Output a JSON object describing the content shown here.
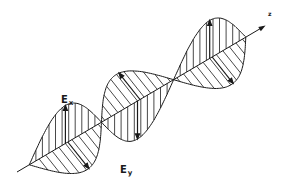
{
  "diagram": {
    "labels": {
      "ex": {
        "main": "E",
        "sub": "x"
      },
      "ey": {
        "main": "E",
        "sub": "y"
      },
      "axis": "z"
    },
    "colors": {
      "background": "#ffffff",
      "stroke": "#1a1a1a"
    },
    "geometry": {
      "axis_start": [
        17,
        172
      ],
      "axis_end": [
        263,
        27
      ],
      "wave_start_t": 0.36,
      "wave_end_t": 0.92,
      "wavelengths": 1.5,
      "ex_amplitude": 38,
      "ey_amplitude": 34,
      "ey_direction": [
        0.62,
        0.78
      ],
      "ex_hatch_count": 22,
      "ey_hatch_count": 22
    }
  }
}
